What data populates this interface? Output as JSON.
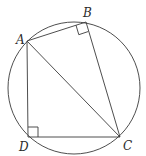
{
  "diagram": {
    "type": "cyclic-quadrilateral",
    "circle": {
      "cx": 74,
      "cy": 88,
      "r": 66
    },
    "points": {
      "A": {
        "label": "A",
        "x": 27,
        "y": 41
      },
      "B": {
        "label": "B",
        "x": 86,
        "y": 22
      },
      "C": {
        "label": "C",
        "x": 120,
        "y": 137
      },
      "D": {
        "label": "D",
        "x": 28,
        "y": 137
      }
    },
    "segments": [
      "AB",
      "BC",
      "CD",
      "DA",
      "AC"
    ],
    "right_angles": [
      "B",
      "D"
    ],
    "colors": {
      "stroke": "#3a3a3a",
      "text": "#2a2a2a",
      "background": "#ffffff"
    }
  }
}
